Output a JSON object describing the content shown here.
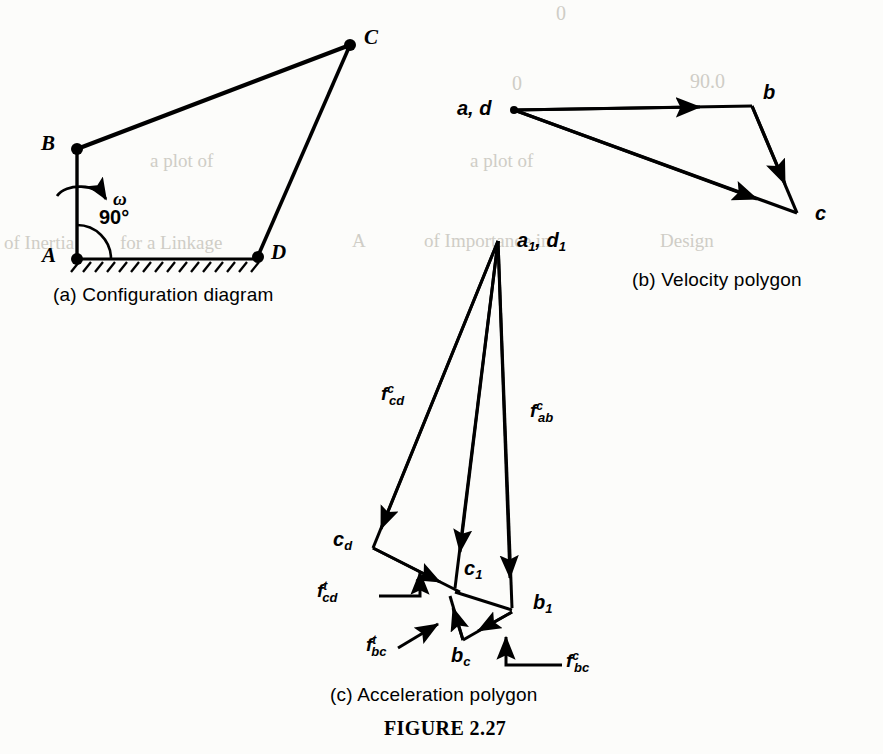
{
  "figure": {
    "caption": "FIGURE 2.27",
    "subfigures": [
      {
        "key": "a",
        "caption": "(a)  Configuration diagram"
      },
      {
        "key": "b",
        "caption": "(b)  Velocity polygon"
      },
      {
        "key": "c",
        "caption": "(c)  Acceleration polygon"
      }
    ]
  },
  "configuration_diagram": {
    "points": {
      "A": "A",
      "B": "B",
      "C": "C",
      "D": "D"
    },
    "angle_label": "90°",
    "omega_label": "ω",
    "links": [
      "A-B",
      "B-C",
      "C-D",
      "A-D"
    ],
    "ground_link": "A-D",
    "fixed_pivots": [
      "A",
      "D"
    ]
  },
  "velocity_polygon": {
    "nodes": [
      {
        "id": "ad",
        "label": "a, d"
      },
      {
        "id": "b",
        "label": "b"
      },
      {
        "id": "c",
        "label": "c"
      }
    ],
    "vectors": [
      "a,d → b",
      "b → c",
      "a,d → c"
    ]
  },
  "acceleration_polygon": {
    "nodes": [
      {
        "id": "a1d1",
        "label": "a₁, d₁",
        "base": "a",
        "sub": "1",
        "base2": "d",
        "sub2": "1"
      },
      {
        "id": "cd",
        "base": "c",
        "sub": "d"
      },
      {
        "id": "c1",
        "base": "c",
        "sub": "1"
      },
      {
        "id": "b1",
        "base": "b",
        "sub": "1"
      },
      {
        "id": "bc",
        "base": "b",
        "sub": "c"
      }
    ],
    "force_labels": [
      {
        "id": "f_cd_c",
        "base": "f",
        "sup": "c",
        "sub": "cd"
      },
      {
        "id": "f_ab_c",
        "base": "f",
        "sup": "c",
        "sub": "ab"
      },
      {
        "id": "f_cd_t",
        "base": "f",
        "sup": "t",
        "sub": "cd"
      },
      {
        "id": "f_bc_t",
        "base": "f",
        "sup": "t",
        "sub": "bc"
      },
      {
        "id": "f_bc_c",
        "base": "f",
        "sup": "c",
        "sub": "bc"
      }
    ]
  },
  "colors": {
    "ink": "#000000",
    "paper": "#fcfcfa",
    "bleed": "#cfcdc6"
  },
  "bleed_text": [
    {
      "t": "0",
      "x": 560,
      "y": 10
    },
    {
      "t": "90.0",
      "x": 700,
      "y": 78
    },
    {
      "t": "0",
      "x": 520,
      "y": 80
    },
    {
      "t": "of Inertia",
      "x": 12,
      "y": 243
    },
    {
      "t": "for a Linkage",
      "x": 96,
      "y": 243
    },
    {
      "t": "A",
      "x": 356,
      "y": 240
    },
    {
      "t": "of Importance in",
      "x": 430,
      "y": 240
    },
    {
      "t": "Design",
      "x": 640,
      "y": 240
    }
  ]
}
